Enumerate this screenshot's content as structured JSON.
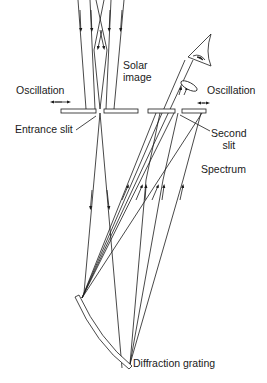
{
  "diagram": {
    "labels": {
      "solar_image_line1": "Solar",
      "solar_image_line2": "image",
      "oscillation_left": "Oscillation",
      "oscillation_right": "Oscillation",
      "entrance_slit": "Entrance slit",
      "second_slit_line1": "Second",
      "second_slit_line2": "slit",
      "spectrum": "Spectrum",
      "diffraction_grating": "Diffraction grating"
    },
    "components": [
      "incoming sunlight rays",
      "entrance slit",
      "diffraction grating",
      "second slit",
      "eyepiece lens",
      "eye"
    ],
    "colors": {
      "stroke": "#1a1a1a",
      "background": "#ffffff"
    }
  }
}
